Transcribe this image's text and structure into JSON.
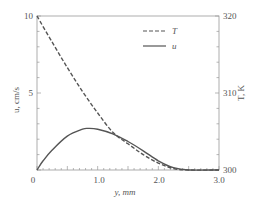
{
  "chart_data": {
    "type": "line",
    "title": "",
    "xlabel": "y, mm",
    "ylabel": "u, cm/s",
    "y2label": "T, K",
    "xlim": [
      0,
      3.0
    ],
    "ylim": [
      0,
      10
    ],
    "y2lim": [
      300,
      320
    ],
    "x_ticks": [
      "0",
      "1.0",
      "2.0",
      "3.0"
    ],
    "y_ticks": [
      "10",
      "5"
    ],
    "y2_ticks": [
      "320",
      "310",
      "300"
    ],
    "grid": false,
    "legend_position": "upper right",
    "legend": [
      {
        "name": "T",
        "style": "dashed"
      },
      {
        "name": "u",
        "style": "solid"
      }
    ],
    "series": [
      {
        "name": "T",
        "axis": "right",
        "style": "dashed",
        "x": [
          0,
          0.25,
          0.5,
          0.75,
          1.0,
          1.25,
          1.5,
          1.75,
          2.0,
          2.25,
          2.5,
          3.0
        ],
        "values": [
          320,
          316.6,
          313.3,
          310.2,
          307.4,
          304.9,
          303.4,
          302.0,
          300.9,
          300.2,
          300.0,
          300.0
        ]
      },
      {
        "name": "u",
        "axis": "left",
        "style": "solid",
        "x": [
          0,
          0.1,
          0.25,
          0.5,
          0.75,
          0.85,
          1.0,
          1.25,
          1.5,
          1.75,
          2.0,
          2.25,
          2.5,
          3.0
        ],
        "values": [
          0,
          0.6,
          1.3,
          2.2,
          2.65,
          2.7,
          2.65,
          2.35,
          1.85,
          1.25,
          0.6,
          0.15,
          0,
          0
        ]
      }
    ]
  },
  "labels": {
    "xlabel": "y, mm",
    "ylabel": "u, cm/s",
    "y2label": "T, K",
    "x_ticks": [
      "0",
      "1.0",
      "2.0",
      "3.0"
    ],
    "y_ticks": [
      "10",
      "5"
    ],
    "y2_ticks": [
      "320",
      "310",
      "300"
    ],
    "legend_T": "T",
    "legend_u": "u"
  }
}
